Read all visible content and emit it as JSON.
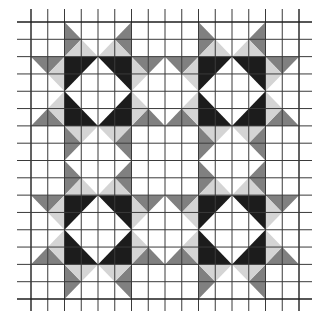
{
  "figure": {
    "grid": {
      "columns": 16,
      "rows": 16,
      "x0": 31,
      "x1": 299,
      "y0": 22,
      "y1": 299,
      "h_line_extent": [
        17,
        312
      ],
      "v_line_extent": [
        9,
        311
      ]
    },
    "colors": {
      "background": "#ffffff",
      "grid": "#3a3a3a",
      "black": "#1c1c1c",
      "dark_gray": "#808080",
      "light_gray": "#d4d4d4"
    },
    "blocks": [
      {
        "name": "block-top-left",
        "col": 2,
        "row": 2
      },
      {
        "name": "block-top-right",
        "col": 10,
        "row": 2
      },
      {
        "name": "block-bottom-left",
        "col": 2,
        "row": 10
      },
      {
        "name": "block-bottom-right",
        "col": 10,
        "row": 10
      }
    ]
  }
}
